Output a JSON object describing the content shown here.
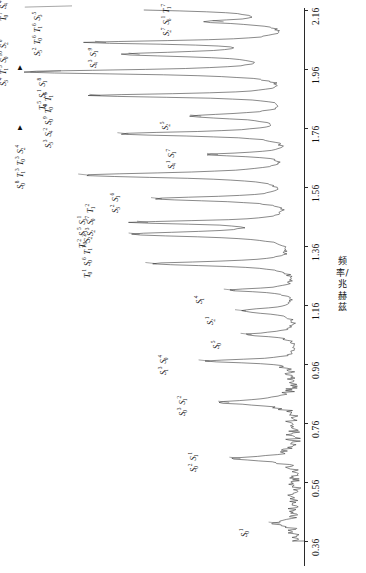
{
  "chart_data": {
    "type": "line",
    "title": "",
    "subtitle": "",
    "xlabel": "频率/兆赫兹",
    "ylabel": "",
    "orientation": "rotated-90-ccw",
    "grid": false,
    "legend": null,
    "axis": {
      "name": "频率/兆赫兹",
      "unit": "兆赫兹",
      "range": [
        0.36,
        2.16
      ],
      "tick_step": 0.2,
      "tick_labels": [
        "0.36",
        "0.56",
        "0.76",
        "0.96",
        "1.16",
        "1.36",
        "1.56",
        "1.76",
        "1.96",
        "2.16"
      ],
      "tick_values": [
        0.36,
        0.56,
        0.76,
        0.96,
        1.16,
        1.36,
        1.56,
        1.76,
        1.96,
        2.16
      ]
    },
    "x": [
      0.36,
      0.56,
      0.76,
      0.96,
      1.16,
      1.36,
      1.56,
      1.76,
      1.96,
      2.16
    ],
    "values": [
      0.06,
      0.1,
      0.14,
      0.3,
      0.4,
      0.62,
      0.7,
      0.78,
      0.95,
      0.92
    ],
    "peaks": [
      {
        "freq": 0.42,
        "amplitude": 0.08,
        "label_tokens": [
          {
            "base": "S",
            "sub": "0",
            "sup": "1"
          }
        ]
      },
      {
        "freq": 0.64,
        "amplitude": 0.22,
        "label_tokens": [
          {
            "base": "S",
            "sub": "0",
            "sup": "2"
          },
          {
            "base": "S",
            "sub": "1",
            "sup": "1"
          }
        ]
      },
      {
        "freq": 0.83,
        "amplitude": 0.26,
        "label_tokens": [
          {
            "base": "S",
            "sub": "0",
            "sup": "3"
          },
          {
            "base": "S",
            "sub": "1",
            "sup": "2"
          }
        ]
      },
      {
        "freq": 0.97,
        "amplitude": 0.33,
        "label_tokens": [
          {
            "base": "S",
            "sub": "1",
            "sup": "3"
          },
          {
            "base": "S",
            "sub": "0",
            "sup": "4"
          }
        ]
      },
      {
        "freq": 1.06,
        "amplitude": 0.18,
        "label_tokens": [
          {
            "base": "S",
            "sub": "0",
            "sup": "5"
          }
        ]
      },
      {
        "freq": 1.14,
        "amplitude": 0.2,
        "label_tokens": [
          {
            "base": "S",
            "sub": "2",
            "sup": "1"
          }
        ]
      },
      {
        "freq": 1.21,
        "amplitude": 0.24,
        "label_tokens": [
          {
            "base": "S",
            "sub": "1",
            "sup": "4"
          }
        ]
      },
      {
        "freq": 1.3,
        "amplitude": 0.52,
        "label_tokens": [
          {
            "base": "T",
            "sub": "0",
            "sup": "1"
          },
          {
            "base": "S",
            "sub": "0",
            "sup": "6"
          },
          {
            "base": "T",
            "sub": "1",
            "sup": "1"
          },
          {
            "base": "S",
            "sub": "2",
            "sup": "2"
          }
        ]
      },
      {
        "freq": 1.4,
        "amplitude": 0.58,
        "label_tokens": [
          {
            "base": "T",
            "sub": "0",
            "sup": "2"
          },
          {
            "base": "S",
            "sub": "1",
            "sup": "5"
          },
          {
            "base": "S",
            "sub": "3",
            "sup": "1"
          }
        ]
      },
      {
        "freq": 1.44,
        "amplitude": 0.55,
        "label_tokens": [
          {
            "base": "S",
            "sub": "2",
            "sup": "3"
          },
          {
            "base": "S",
            "sub": "0",
            "sup": "7"
          },
          {
            "base": "T",
            "sub": "1",
            "sup": "2"
          }
        ]
      },
      {
        "freq": 1.52,
        "amplitude": 0.5,
        "label_tokens": [
          {
            "base": "S",
            "sub": "3",
            "sup": "2"
          },
          {
            "base": "S",
            "sub": "1",
            "sup": "6"
          }
        ]
      },
      {
        "freq": 1.6,
        "amplitude": 0.76,
        "label_tokens": [
          {
            "base": "S",
            "sub": "0",
            "sup": "8"
          },
          {
            "base": "T",
            "sub": "1",
            "sup": "3"
          },
          {
            "base": "T",
            "sub": "0",
            "sup": "3"
          },
          {
            "base": "S",
            "sub": "2",
            "sup": "4"
          }
        ]
      },
      {
        "freq": 1.67,
        "amplitude": 0.3,
        "label_tokens": [
          {
            "base": "S",
            "sub": "4",
            "sup": "1"
          },
          {
            "base": "S",
            "sub": "1",
            "sup": "7"
          }
        ]
      },
      {
        "freq": 1.74,
        "amplitude": 0.62,
        "label_tokens": [
          {
            "base": "S",
            "sub": "3",
            "sup": "3"
          },
          {
            "base": "S",
            "sub": "4",
            "sup": "2"
          },
          {
            "base": "S",
            "sub": "0",
            "sup": "9"
          },
          {
            "base": "T",
            "sub": "0",
            "sup": "4"
          },
          {
            "base": "T",
            "sub": "1",
            "sup": "4"
          }
        ]
      },
      {
        "freq": 1.8,
        "amplitude": 0.36,
        "label_tokens": [
          {
            "base": "S",
            "sub": "2",
            "sup": "5"
          }
        ]
      },
      {
        "freq": 1.87,
        "amplitude": 0.72,
        "label_tokens": [
          {
            "base": "T",
            "sub": "0",
            "sup": "5"
          },
          {
            "base": "S",
            "sub": "5",
            "sup": "1"
          },
          {
            "base": "S",
            "sub": "1",
            "sup": "8"
          }
        ]
      },
      {
        "freq": 1.95,
        "amplitude": 0.97,
        "label_tokens": [
          {
            "base": "S",
            "sub": "3",
            "sup": "4"
          },
          {
            "base": "T",
            "sub": "1",
            "sup": "5"
          },
          {
            "base": "S",
            "sub": "0",
            "sup": "10"
          },
          {
            "base": "S",
            "sub": "2",
            "sup": "6"
          }
        ]
      },
      {
        "freq": 2.01,
        "amplitude": 0.58,
        "label_tokens": [
          {
            "base": "S",
            "sub": "4",
            "sup": "3"
          },
          {
            "base": "S",
            "sub": "1",
            "sup": "9"
          }
        ]
      },
      {
        "freq": 2.05,
        "amplitude": 0.7,
        "label_tokens": [
          {
            "base": "S",
            "sub": "5",
            "sup": "2"
          },
          {
            "base": "T",
            "sub": "0",
            "sup": "6"
          },
          {
            "base": "T",
            "sub": "1",
            "sup": "6"
          },
          {
            "base": "S",
            "sub": "3",
            "sup": "5"
          }
        ]
      },
      {
        "freq": 2.12,
        "amplitude": 0.28,
        "label_tokens": [
          {
            "base": "S",
            "sub": "2",
            "sup": "7"
          },
          {
            "base": "S",
            "sub": "6",
            "sup": "1"
          },
          {
            "base": "T",
            "sub": "1",
            "sup": "7"
          }
        ]
      },
      {
        "freq": 2.17,
        "amplitude": 0.99,
        "label_tokens": [
          {
            "base": "T",
            "sub": "0",
            "sup": "7"
          },
          {
            "base": "S",
            "sub": "4",
            "sup": "4"
          },
          {
            "base": "S",
            "sub": "0",
            "sup": "11"
          },
          {
            "base": "T",
            "sub": "1",
            "sup": "8"
          },
          {
            "base": "S",
            "sub": "5",
            "sup": "3"
          }
        ]
      },
      {
        "freq": 2.24,
        "amplitude": 0.33,
        "label_tokens": [
          {
            "base": "S",
            "sub": "3",
            "sup": "6"
          },
          {
            "base": "T",
            "sub": "0",
            "sup": "8"
          },
          {
            "base": "T",
            "sub": "1",
            "sup": "9"
          }
        ]
      }
    ],
    "markers": [
      {
        "name": "left-arrow-marker-upper",
        "freq": 2.17
      },
      {
        "name": "left-arrow-marker-lower",
        "freq": 1.95
      }
    ]
  },
  "axis_title": "频率/兆赫兹",
  "tick_labels": {
    "t0": "0.36",
    "t1": "0.56",
    "t2": "0.76",
    "t3": "0.96",
    "t4": "1.16",
    "t5": "1.36",
    "t6": "1.56",
    "t7": "1.76",
    "t8": "1.96",
    "t9": "2.16"
  },
  "peak_labels": {
    "p0": "S₀¹",
    "p1": "S₀² S₁¹",
    "p2": "S₀³ S₁²",
    "p3": "S₁³ S₀⁴",
    "p4": "S₀⁵",
    "p5": "S₂¹",
    "p6": "S₁⁴",
    "p7": "T₀¹ S₀⁶ T₁¹ S₂²",
    "p8": "T₀² S₁⁵ S₃¹",
    "p9": "S₂³ S₀⁷ T₁²",
    "p10": "S₃² S₁⁶",
    "p11": "S₀⁸ T₁³ T₀³ S₂⁴",
    "p12": "S₄¹ S₁⁷",
    "p13": "S₃³ S₄² S₀⁹ T₀⁴ T₁⁴",
    "p14": "S₂⁵",
    "p15": "T₀⁵ S₅¹ S₁⁸",
    "p16": "S₃⁴ T₁⁵ S₀¹⁰ S₂⁶",
    "p17": "S₄³ S₁⁹",
    "p18": "S₅² T₀⁶ T₁⁶ S₃⁵",
    "p19": "S₂⁷ S₆¹ T₁⁷",
    "p20": "T₀⁷ S₄⁴ S₀¹¹ T₁⁸ S₅³",
    "p21": "S₃⁶ T₀⁸ T₁⁹"
  },
  "colors": {
    "axis": "#2a2a2a",
    "trace": "#3a3a3a",
    "text": "#111111",
    "background": "#ffffff"
  }
}
